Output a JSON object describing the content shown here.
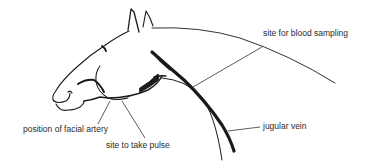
{
  "diagram": {
    "labels": {
      "blood_sampling": "site for blood sampling",
      "jugular_vein": "jugular vein",
      "facial_artery": "position of facial artery",
      "pulse": "site to take pulse"
    },
    "colors": {
      "line": "#1a1a1a",
      "text": "#2a2a2a",
      "background": "#ffffff"
    }
  }
}
